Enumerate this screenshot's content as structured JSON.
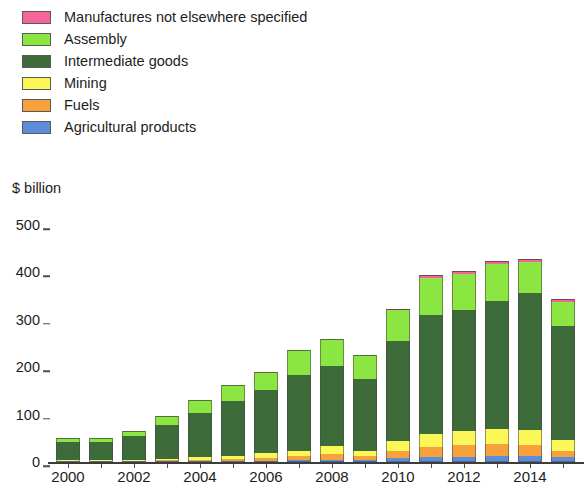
{
  "axis_title": "$ billion",
  "legend": {
    "items": [
      {
        "label": "Manufactures not elsewhere specified",
        "color": "#f4659b"
      },
      {
        "label": "Assembly",
        "color": "#8ce642"
      },
      {
        "label": "Intermediate goods",
        "color": "#3e6b3a"
      },
      {
        "label": "Mining",
        "color": "#fbf759"
      },
      {
        "label": "Fuels",
        "color": "#f6a13c"
      },
      {
        "label": "Agricultural products",
        "color": "#5b8dd9"
      }
    ]
  },
  "yaxis": {
    "ticks": [
      "500",
      "400",
      "300",
      "200",
      "100",
      "0"
    ],
    "tick_values": [
      500,
      400,
      300,
      200,
      100,
      0
    ]
  },
  "xaxis": {
    "labels": [
      "2000",
      "2002",
      "2004",
      "2006",
      "2008",
      "2010",
      "2012",
      "2014"
    ]
  },
  "chart_data": {
    "type": "bar",
    "subtype": "stacked",
    "title": "",
    "xlabel": "",
    "ylabel": "$ billion",
    "ylim": [
      0,
      500
    ],
    "grid": false,
    "legend_position": "top-left",
    "categories": [
      "2000",
      "2001",
      "2002",
      "2003",
      "2004",
      "2005",
      "2006",
      "2007",
      "2008",
      "2009",
      "2010",
      "2011",
      "2012",
      "2013",
      "2014",
      "2015"
    ],
    "series": [
      {
        "name": "Agricultural products",
        "color": "#5b8dd9",
        "values": [
          1,
          1,
          1,
          1,
          2,
          2,
          3,
          4,
          5,
          5,
          8,
          10,
          11,
          12,
          12,
          10
        ]
      },
      {
        "name": "Fuels",
        "color": "#f6a13c",
        "values": [
          1,
          1,
          1,
          2,
          3,
          4,
          6,
          8,
          12,
          8,
          16,
          22,
          24,
          25,
          24,
          14
        ]
      },
      {
        "name": "Mining",
        "color": "#fbf759",
        "values": [
          2,
          2,
          2,
          3,
          5,
          7,
          9,
          12,
          16,
          11,
          21,
          28,
          31,
          33,
          31,
          22
        ]
      },
      {
        "name": "Intermediate goods",
        "color": "#3e6b3a",
        "values": [
          37,
          37,
          50,
          70,
          94,
          115,
          133,
          160,
          170,
          152,
          210,
          250,
          255,
          270,
          290,
          240
        ]
      },
      {
        "name": "Assembly",
        "color": "#8ce642",
        "values": [
          9,
          9,
          11,
          19,
          26,
          35,
          38,
          52,
          56,
          50,
          65,
          78,
          76,
          78,
          65,
          52
        ]
      },
      {
        "name": "Manufactures not elsewhere specified",
        "color": "#f4659b",
        "values": [
          0,
          0,
          0,
          0,
          0,
          0,
          0,
          0,
          0,
          0,
          2,
          6,
          6,
          7,
          7,
          6
        ]
      }
    ],
    "totals": [
      50,
      50,
      65,
      95,
      130,
      163,
      189,
      236,
      259,
      226,
      322,
      394,
      403,
      425,
      429,
      344
    ]
  }
}
